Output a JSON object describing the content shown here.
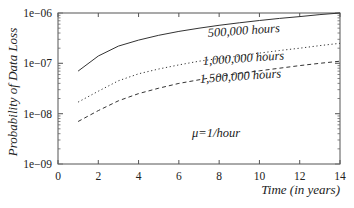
{
  "chart_data": {
    "type": "line",
    "title": "",
    "xlabel": "Time (in years)",
    "ylabel": "Probability of Data Loss",
    "xlim": [
      0,
      14
    ],
    "ylim": [
      1e-09,
      1e-06
    ],
    "yscale": "log",
    "grid": false,
    "x_ticks": [
      0,
      2,
      4,
      6,
      8,
      10,
      12,
      14
    ],
    "x_tick_labels": [
      "0",
      "2",
      "4",
      "6",
      "8",
      "10",
      "12",
      "14"
    ],
    "y_ticks": [
      1e-09,
      1e-08,
      1e-07,
      1e-06
    ],
    "y_tick_labels": [
      "1e−09",
      "1e−08",
      "1e−07",
      "1e−06"
    ],
    "x": [
      1,
      2,
      3,
      4,
      5,
      6,
      7,
      8,
      9,
      10,
      11,
      12,
      13,
      14
    ],
    "series": [
      {
        "name": "500,000 hours",
        "style": "solid",
        "values": [
          7e-08,
          1.4e-07,
          2.2e-07,
          2.9e-07,
          3.6e-07,
          4.3e-07,
          5e-07,
          5.7e-07,
          6.4e-07,
          7.1e-07,
          7.8e-07,
          8.5e-07,
          9.3e-07,
          1e-06
        ],
        "label_pos": {
          "x": 208,
          "y": 37
        }
      },
      {
        "name": "1,000,000 hours",
        "style": "dotted",
        "values": [
          1.7e-08,
          2.8e-08,
          4.5e-08,
          6.2e-08,
          7.7e-08,
          9.3e-08,
          1.1e-07,
          1.25e-07,
          1.4e-07,
          1.6e-07,
          1.8e-07,
          2e-07,
          2.25e-07,
          2.5e-07
        ],
        "label_pos": {
          "x": 203,
          "y": 65
        }
      },
      {
        "name": "1,500,000 hours",
        "style": "dashed",
        "values": [
          7e-09,
          1.15e-08,
          1.8e-08,
          2.5e-08,
          3.2e-08,
          4e-08,
          4.7e-08,
          5.5e-08,
          6.3e-08,
          7.1e-08,
          8e-08,
          9e-08,
          1e-07,
          1.1e-07
        ],
        "label_pos": {
          "x": 200,
          "y": 83
        }
      }
    ],
    "annotations": [
      {
        "text": "μ=1/hour",
        "x": 192,
        "y": 137
      }
    ],
    "legend": "inline labels"
  }
}
